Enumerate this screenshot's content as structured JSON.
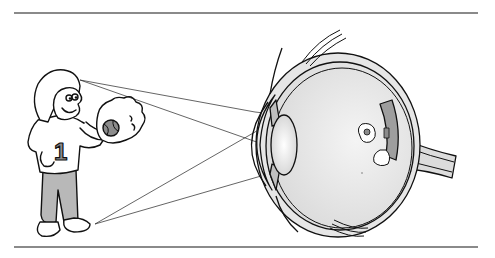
{
  "figure": {
    "shirt_number": "1",
    "elements": [
      "child-figure",
      "baseball-glove",
      "baseball",
      "light-rays",
      "eye-cross-section",
      "cornea",
      "iris",
      "lens",
      "retina",
      "optic-nerve",
      "eyelids",
      "eye-muscles",
      "inverted-image"
    ]
  },
  "colors": {
    "line": "#111111",
    "rule": "#8a8a8a",
    "fill_light": "#d9d9d9",
    "fill_mid": "#a8a8a8",
    "fill_dark": "#7a7a7a",
    "background": "#ffffff"
  }
}
